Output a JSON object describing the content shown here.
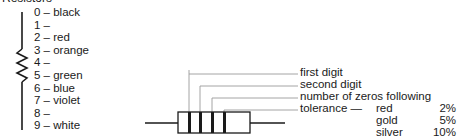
{
  "title": "Resistors",
  "color_codes": [
    {
      "digit": "0",
      "color": "black"
    },
    {
      "digit": "1",
      "color": ""
    },
    {
      "digit": "2",
      "color": "red"
    },
    {
      "digit": "3",
      "color": "orange"
    },
    {
      "digit": "4",
      "color": ""
    },
    {
      "digit": "5",
      "color": "green"
    },
    {
      "digit": "6",
      "color": "blue"
    },
    {
      "digit": "7",
      "color": "violet"
    },
    {
      "digit": "8",
      "color": ""
    },
    {
      "digit": "9",
      "color": "white"
    }
  ],
  "band_labels": {
    "first": "first digit",
    "second": "second digit",
    "third": "number of zeros following",
    "fourth": "tolerance —"
  },
  "tolerances": [
    {
      "name": "red",
      "value": "2%"
    },
    {
      "name": "gold",
      "value": "5%"
    },
    {
      "name": "silver",
      "value": "10%"
    },
    {
      "name": "no band",
      "value": "20%"
    }
  ]
}
